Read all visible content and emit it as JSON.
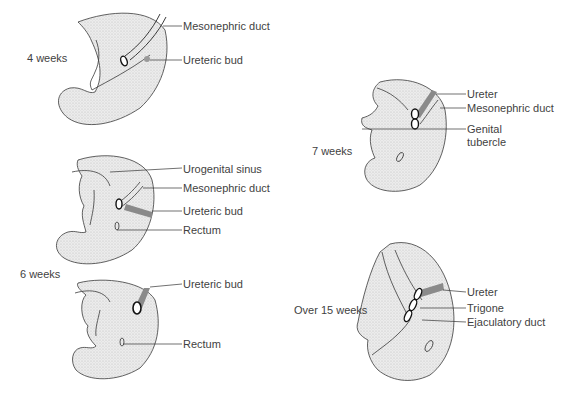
{
  "figure": {
    "panels": [
      {
        "stage": "4 weeks",
        "labels": [
          "Mesonephric duct",
          "Ureteric bud"
        ]
      },
      {
        "stage": "6 weeks",
        "labels": [
          "Urogenital sinus",
          "Mesonephric duct",
          "Ureteric bud",
          "Rectum"
        ]
      },
      {
        "stage": "6 weeks (later)",
        "labels": [
          "Ureteric bud",
          "Rectum"
        ]
      },
      {
        "stage": "7 weeks",
        "labels": [
          "Ureter",
          "Mesonephric duct",
          "Genital",
          "tubercle"
        ]
      },
      {
        "stage": "Over 15 weeks",
        "labels": [
          "Ureter",
          "Trigone",
          "Ejaculatory duct"
        ]
      }
    ],
    "shared_stage_label": "6 weeks",
    "colors": {
      "tissue": "#e6e6e6",
      "outline": "#2a2a2a",
      "ureter": "#8a8a8a",
      "text": "#3f3f3f"
    }
  }
}
